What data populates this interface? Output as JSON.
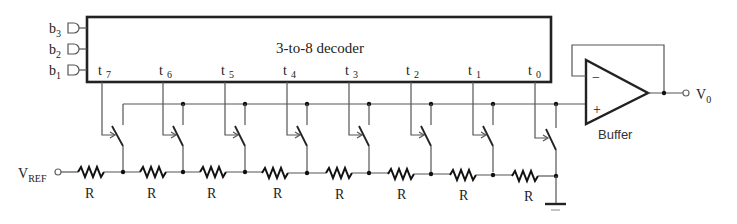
{
  "diagram": {
    "decoder": {
      "label": "3-to-8 decoder",
      "inputs": [
        {
          "name": "b",
          "sub": "3"
        },
        {
          "name": "b",
          "sub": "2"
        },
        {
          "name": "b",
          "sub": "1"
        }
      ],
      "outputs": [
        {
          "name": "t",
          "sub": "7"
        },
        {
          "name": "t",
          "sub": "6"
        },
        {
          "name": "t",
          "sub": "5"
        },
        {
          "name": "t",
          "sub": "4"
        },
        {
          "name": "t",
          "sub": "3"
        },
        {
          "name": "t",
          "sub": "2"
        },
        {
          "name": "t",
          "sub": "1"
        },
        {
          "name": "t",
          "sub": "0"
        }
      ]
    },
    "vref": {
      "name": "V",
      "sub": "REF"
    },
    "resistors": [
      "R",
      "R",
      "R",
      "R",
      "R",
      "R",
      "R",
      "R"
    ],
    "buffer": {
      "label": "Buffer",
      "minus": "−",
      "plus": "+"
    },
    "output": {
      "name": "V",
      "sub": "0"
    }
  }
}
